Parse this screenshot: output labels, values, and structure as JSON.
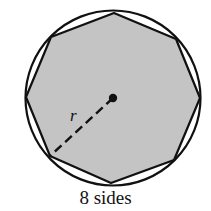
{
  "figure": {
    "caption": "8 sides",
    "radius_label": "r",
    "sides": 8,
    "colors": {
      "fill": "#c4c4c4",
      "stroke": "#111111",
      "background": "#ffffff"
    }
  }
}
